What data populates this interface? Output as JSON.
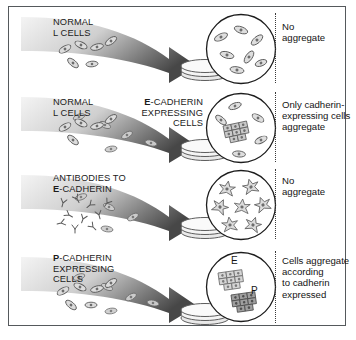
{
  "figure": {
    "border_color": "#55595c",
    "background": "#ffffff",
    "arrow_gradient": {
      "from": "#f2f2f2",
      "to": "#4a4a4a"
    },
    "cell_fill": "#d8d8d8",
    "cell_stroke": "#5a5a5a",
    "nucleus_fill": "#6d6d6d"
  },
  "rows": [
    {
      "id": "normal-l-cells",
      "left_label_lines": [
        {
          "bold": "",
          "rest": "NORMAL"
        },
        {
          "bold": "",
          "rest": "L CELLS"
        }
      ],
      "mid_label_lines": [],
      "caption_lines": [
        "No",
        "aggregate"
      ],
      "circle_content": "scattered-single-cells",
      "aggregate_labels": []
    },
    {
      "id": "e-cadherin-expressing-cells",
      "left_label_lines": [
        {
          "bold": "",
          "rest": "NORMAL"
        },
        {
          "bold": "",
          "rest": "L CELLS"
        }
      ],
      "mid_label_lines": [
        {
          "bold": "E",
          "rest": "-CADHERIN"
        },
        {
          "bold": "",
          "rest": "EXPRESSING"
        },
        {
          "bold": "",
          "rest": "CELLS"
        }
      ],
      "caption_lines": [
        "Only cadherin-",
        "expressing cells",
        "aggregate"
      ],
      "circle_content": "one-aggregate-plus-singles",
      "aggregate_labels": []
    },
    {
      "id": "antibodies-to-e-cadherin",
      "left_label_lines": [
        {
          "bold": "",
          "rest": "ANTIBODIES TO"
        },
        {
          "bold": "E",
          "rest": "-CADHERIN"
        }
      ],
      "mid_label_lines": [],
      "caption_lines": [
        "No",
        "aggregate"
      ],
      "circle_content": "antibody-coated-spiky-cells",
      "aggregate_labels": []
    },
    {
      "id": "p-cadherin-expressing-cells",
      "left_label_lines": [
        {
          "bold": "P",
          "rest": "-CADHERIN"
        },
        {
          "bold": "",
          "rest": "EXPRESSING"
        },
        {
          "bold": "",
          "rest": "CELLS"
        }
      ],
      "mid_label_lines": [],
      "caption_lines": [
        "Cells aggregate",
        "according",
        "to cadherin",
        "expressed"
      ],
      "circle_content": "two-separate-aggregates",
      "aggregate_labels": [
        "E",
        "P"
      ]
    }
  ]
}
